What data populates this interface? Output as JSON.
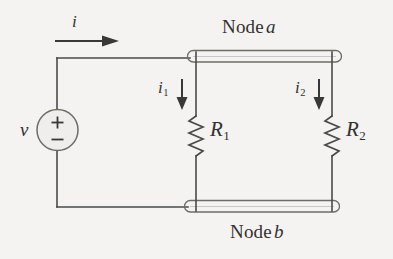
{
  "figure": {
    "background_color": "#f4f3f1",
    "stroke_color": "#4a4a4a",
    "text_color": "#33312f"
  },
  "labels": {
    "node_a_prefix": "Node",
    "node_a_name": "a",
    "node_b_prefix": "Node",
    "node_b_name": "b",
    "source_voltage": "v",
    "source_plus": "+",
    "source_minus": "−",
    "resistor_1_symbol": "R",
    "resistor_1_subscript": "1",
    "resistor_2_symbol": "R",
    "resistor_2_subscript": "2",
    "current_total": "i",
    "current_1_symbol": "i",
    "current_1_subscript": "1",
    "current_2_symbol": "i",
    "current_2_subscript": "2"
  },
  "components": {
    "voltage_source": {
      "name": "independent-voltage-source",
      "shape": "circle",
      "polarity_top": "+",
      "polarity_bottom": "−"
    },
    "resistors": [
      {
        "name": "resistor-r1",
        "label": "R1",
        "shape": "zigzag"
      },
      {
        "name": "resistor-r2",
        "label": "R2",
        "shape": "zigzag"
      }
    ],
    "nodes": [
      {
        "name": "node-a-bar",
        "label": "Node a",
        "shape": "stadium-outline",
        "position": "top"
      },
      {
        "name": "node-b-bar",
        "label": "Node b",
        "shape": "stadium-outline",
        "position": "bottom"
      }
    ],
    "current_arrows": [
      {
        "name": "current-arrow-i",
        "label": "i",
        "direction": "right"
      },
      {
        "name": "current-arrow-i1",
        "label": "i1",
        "direction": "down"
      },
      {
        "name": "current-arrow-i2",
        "label": "i2",
        "direction": "down"
      }
    ]
  },
  "icons": {
    "arrow_right": "arrow-right-icon",
    "arrow_down": "arrow-down-icon",
    "zigzag": "resistor-zigzag-icon",
    "circle_source": "voltage-source-circle-icon"
  }
}
